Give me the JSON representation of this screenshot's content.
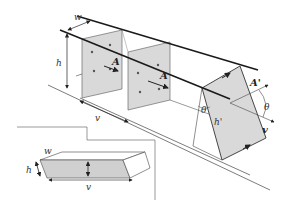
{
  "figure": {
    "labels": {
      "width": "w",
      "height": "h",
      "area": "A",
      "tilted_area": "A'",
      "angle": "θ",
      "angle2": "θ",
      "tilted_height": "h'",
      "velocity": "v",
      "velocity_bottom": "v",
      "inset_width": "w",
      "inset_height": "h",
      "inset_length": "v"
    },
    "colors": {
      "panel_fill": "#d9d9d9",
      "line": "#333333",
      "thick_line": "#1a1a1a",
      "background": "#ffffff"
    }
  }
}
